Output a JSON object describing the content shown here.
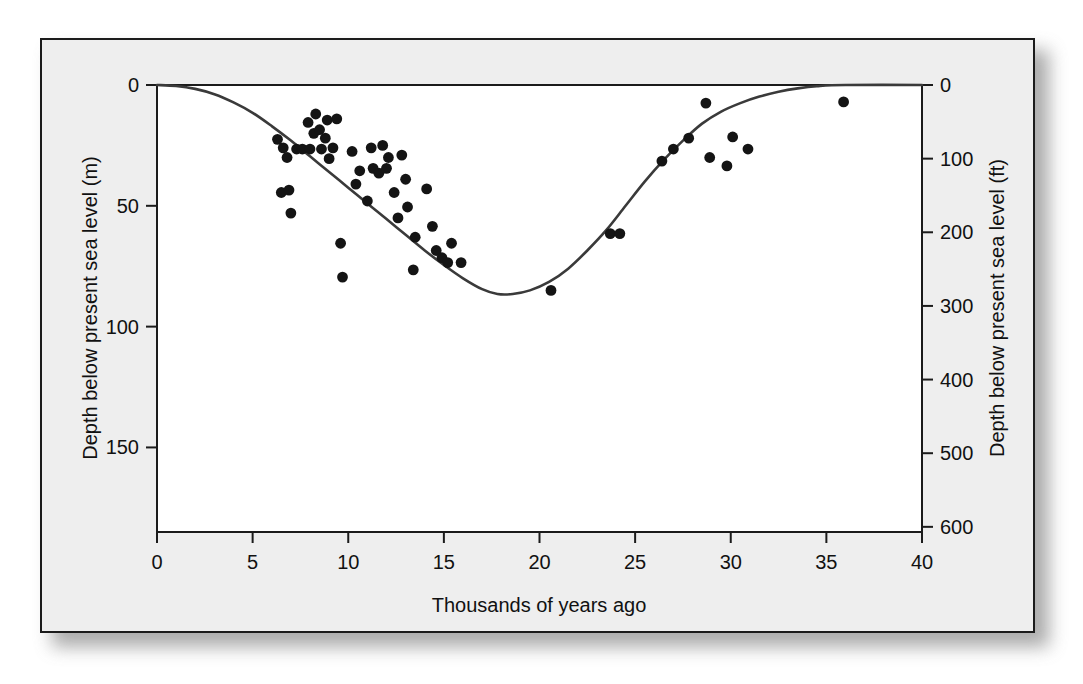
{
  "figure": {
    "background_color": "#eeeeee",
    "plot_background_color": "#ffffff",
    "frame_color": "#1b1b1b",
    "ink_color": "#111111"
  },
  "chart_data": {
    "type": "scatter",
    "title": "",
    "subtitle": "",
    "xlabel": "Thousands of years ago",
    "ylabel": "Depth below present sea level (m)",
    "y2label": "Depth below present sea level (ft)",
    "xlim": [
      0,
      40
    ],
    "ylim": [
      0,
      185
    ],
    "y2lim": [
      0,
      607
    ],
    "x_inverted": false,
    "y_inverted": true,
    "grid": false,
    "legend": null,
    "xticks": [
      0,
      5,
      10,
      15,
      20,
      25,
      30,
      35,
      40
    ],
    "xticklabels": [
      "0",
      "5",
      "10",
      "15",
      "20",
      "25",
      "30",
      "35",
      "40"
    ],
    "yticks": [
      0,
      50,
      100,
      150
    ],
    "yticklabels": [
      "0",
      "50",
      "100",
      "150"
    ],
    "y2ticks": [
      0,
      100,
      200,
      300,
      400,
      500,
      600
    ],
    "y2ticklabels": [
      "0",
      "100",
      "200",
      "300",
      "400",
      "500",
      "600"
    ],
    "series": [
      {
        "name": "Sea-level data points",
        "type": "scatter",
        "marker": "filled-circle",
        "color": "#141414",
        "points": [
          [
            6.3,
            22.5
          ],
          [
            6.6,
            26.0
          ],
          [
            6.8,
            30.0
          ],
          [
            6.5,
            44.5
          ],
          [
            6.9,
            43.5
          ],
          [
            7.0,
            53.0
          ],
          [
            7.3,
            26.5
          ],
          [
            7.6,
            26.5
          ],
          [
            7.9,
            15.5
          ],
          [
            8.2,
            20.0
          ],
          [
            8.0,
            26.5
          ],
          [
            8.3,
            12.0
          ],
          [
            8.5,
            18.5
          ],
          [
            8.6,
            26.5
          ],
          [
            8.9,
            14.5
          ],
          [
            8.8,
            22.0
          ],
          [
            9.0,
            30.5
          ],
          [
            9.2,
            26.0
          ],
          [
            9.4,
            14.0
          ],
          [
            9.6,
            65.5
          ],
          [
            9.7,
            79.5
          ],
          [
            10.2,
            27.5
          ],
          [
            10.4,
            41.0
          ],
          [
            10.6,
            35.5
          ],
          [
            11.0,
            48.0
          ],
          [
            11.3,
            34.5
          ],
          [
            11.2,
            26.0
          ],
          [
            11.6,
            36.5
          ],
          [
            11.8,
            25.0
          ],
          [
            12.0,
            34.5
          ],
          [
            12.1,
            30.0
          ],
          [
            12.4,
            44.5
          ],
          [
            12.6,
            55.0
          ],
          [
            12.8,
            29.0
          ],
          [
            13.0,
            39.0
          ],
          [
            13.1,
            50.5
          ],
          [
            13.5,
            63.0
          ],
          [
            13.4,
            76.5
          ],
          [
            14.1,
            43.0
          ],
          [
            14.4,
            58.5
          ],
          [
            14.6,
            68.5
          ],
          [
            14.9,
            71.5
          ],
          [
            15.2,
            73.5
          ],
          [
            15.4,
            65.5
          ],
          [
            15.9,
            73.5
          ],
          [
            20.6,
            85.0
          ],
          [
            23.7,
            61.5
          ],
          [
            24.2,
            61.5
          ],
          [
            26.4,
            31.5
          ],
          [
            27.0,
            26.5
          ],
          [
            27.8,
            22.0
          ],
          [
            28.7,
            7.5
          ],
          [
            28.9,
            30.0
          ],
          [
            29.8,
            33.5
          ],
          [
            30.1,
            21.5
          ],
          [
            30.9,
            26.5
          ],
          [
            35.9,
            7.0
          ]
        ]
      },
      {
        "name": "Fitted sea-level curve",
        "type": "line",
        "color": "#3a3a3a",
        "points": [
          [
            0.0,
            0.0
          ],
          [
            1.0,
            0.4
          ],
          [
            2.0,
            1.6
          ],
          [
            3.0,
            3.8
          ],
          [
            4.0,
            7.2
          ],
          [
            5.0,
            11.5
          ],
          [
            6.0,
            17.0
          ],
          [
            7.0,
            23.0
          ],
          [
            8.0,
            29.5
          ],
          [
            9.0,
            36.0
          ],
          [
            10.0,
            42.5
          ],
          [
            11.0,
            49.0
          ],
          [
            12.0,
            55.5
          ],
          [
            13.0,
            62.0
          ],
          [
            14.0,
            68.5
          ],
          [
            15.0,
            74.5
          ],
          [
            16.0,
            80.0
          ],
          [
            17.0,
            84.5
          ],
          [
            17.8,
            86.5
          ],
          [
            18.6,
            86.5
          ],
          [
            19.5,
            85.0
          ],
          [
            20.5,
            81.5
          ],
          [
            21.5,
            76.0
          ],
          [
            22.5,
            68.5
          ],
          [
            23.5,
            60.0
          ],
          [
            24.5,
            50.0
          ],
          [
            25.5,
            40.0
          ],
          [
            26.5,
            31.0
          ],
          [
            27.5,
            23.0
          ],
          [
            28.5,
            16.0
          ],
          [
            29.5,
            11.0
          ],
          [
            30.5,
            7.5
          ],
          [
            31.5,
            4.8
          ],
          [
            32.5,
            2.8
          ],
          [
            33.5,
            1.4
          ],
          [
            34.5,
            0.5
          ],
          [
            36.0,
            0.0
          ],
          [
            40.0,
            0.0
          ]
        ]
      }
    ]
  }
}
